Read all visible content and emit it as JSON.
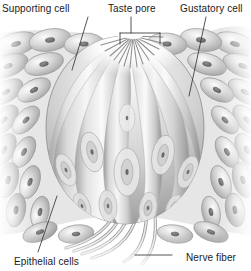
{
  "figure": {
    "style": "grayscale pencil/airbrush anatomical illustration",
    "width": 251,
    "height": 271,
    "background_color": "#ffffff"
  },
  "labels": {
    "supporting_cell": "Supporting cell",
    "taste_pore": "Taste pore",
    "gustatory_cell": "Gustatory cell",
    "epithelial_cells": "Epithelial cells",
    "nerve_fiber": "Nerve fiber"
  },
  "colors": {
    "ink": "#1b1b1b",
    "leader_line": "#2a2a2a",
    "tissue_light": "#f2f2f2",
    "tissue_mid": "#c9c9c9",
    "tissue_dark": "#8e8e8e",
    "tissue_shadow": "#6e6e6e",
    "nucleus": "#6a6a6a",
    "background": "#ffffff"
  },
  "structures": [
    {
      "name": "taste-pore",
      "description": "small opening at apex of taste bud with radiating microvilli"
    },
    {
      "name": "gustatory-cells",
      "description": "elongated spindle-shaped receptor cells with central nuclei forming the bud"
    },
    {
      "name": "supporting-cells",
      "description": "sustentacular cells interleaved between gustatory cells"
    },
    {
      "name": "epithelial-cells",
      "description": "stratified squamous epithelium surrounding the bud, rounded cells with dark nuclei"
    },
    {
      "name": "nerve-fiber",
      "description": "bundle of sensory nerve fibers entering the base of the taste bud"
    }
  ]
}
